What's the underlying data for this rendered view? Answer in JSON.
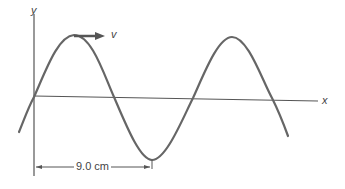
{
  "diagram": {
    "type": "transverse-wave",
    "axes": {
      "y_label": "y",
      "x_label": "x"
    },
    "velocity_label": "v",
    "dimension_label": "9.0 cm",
    "colors": {
      "wave": "#666666",
      "axis": "#555555",
      "arrow": "#555555",
      "text": "#444444"
    }
  }
}
